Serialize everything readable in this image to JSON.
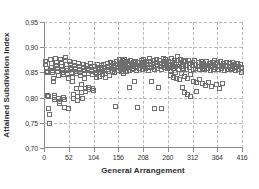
{
  "chart_data": {
    "type": "scatter",
    "title": "",
    "xlabel": "General Arrangement",
    "ylabel": "Attained Subdivision Index",
    "xlim": [
      0,
      416
    ],
    "ylim": [
      0.7,
      0.95
    ],
    "xticks": [
      0,
      52,
      104,
      156,
      208,
      260,
      312,
      364,
      416
    ],
    "xticklabels": [
      "0",
      "52",
      "104",
      "156",
      "208",
      "260",
      "312",
      "364",
      "416"
    ],
    "yticks": [
      0.7,
      0.75,
      0.8,
      0.85,
      0.9,
      0.95
    ],
    "yticklabels": [
      "0,70",
      "0,75",
      "0,80",
      "0,85",
      "0,90",
      "0,95"
    ],
    "decimal_separator": ",",
    "grid": true,
    "grid_style": "dashed",
    "grid_color": "#b9b9b9",
    "axis_color": "#8a8a8a",
    "legend": null,
    "marker": "open-square",
    "marker_color": "#6f6f6f",
    "marker_size": 4,
    "series": [
      {
        "name": "Attained Subdivision Index",
        "points": [
          [
            2,
            0.873
          ],
          [
            3,
            0.866
          ],
          [
            4,
            0.858
          ],
          [
            5,
            0.852
          ],
          [
            6,
            0.851
          ],
          [
            7,
            0.806
          ],
          [
            8,
            0.803
          ],
          [
            9,
            0.779
          ],
          [
            10,
            0.767
          ],
          [
            11,
            0.75
          ],
          [
            13,
            0.877
          ],
          [
            14,
            0.869
          ],
          [
            15,
            0.861
          ],
          [
            16,
            0.855
          ],
          [
            17,
            0.85
          ],
          [
            18,
            0.838
          ],
          [
            19,
            0.833
          ],
          [
            20,
            0.806
          ],
          [
            21,
            0.801
          ],
          [
            22,
            0.798
          ],
          [
            24,
            0.879
          ],
          [
            25,
            0.871
          ],
          [
            26,
            0.864
          ],
          [
            27,
            0.858
          ],
          [
            28,
            0.853
          ],
          [
            29,
            0.845
          ],
          [
            30,
            0.8
          ],
          [
            31,
            0.794
          ],
          [
            32,
            0.789
          ],
          [
            34,
            0.876
          ],
          [
            35,
            0.87
          ],
          [
            36,
            0.862
          ],
          [
            37,
            0.857
          ],
          [
            38,
            0.851
          ],
          [
            39,
            0.846
          ],
          [
            40,
            0.802
          ],
          [
            41,
            0.797
          ],
          [
            42,
            0.781
          ],
          [
            44,
            0.88
          ],
          [
            45,
            0.874
          ],
          [
            46,
            0.867
          ],
          [
            47,
            0.859
          ],
          [
            48,
            0.854
          ],
          [
            49,
            0.848
          ],
          [
            50,
            0.838
          ],
          [
            51,
            0.779
          ],
          [
            53,
            0.873
          ],
          [
            54,
            0.866
          ],
          [
            55,
            0.861
          ],
          [
            56,
            0.856
          ],
          [
            57,
            0.85
          ],
          [
            58,
            0.841
          ],
          [
            59,
            0.832
          ],
          [
            60,
            0.807
          ],
          [
            61,
            0.8
          ],
          [
            63,
            0.87
          ],
          [
            64,
            0.864
          ],
          [
            65,
            0.858
          ],
          [
            66,
            0.853
          ],
          [
            67,
            0.848
          ],
          [
            68,
            0.819
          ],
          [
            69,
            0.804
          ],
          [
            70,
            0.795
          ],
          [
            72,
            0.868
          ],
          [
            73,
            0.862
          ],
          [
            74,
            0.857
          ],
          [
            75,
            0.851
          ],
          [
            76,
            0.845
          ],
          [
            77,
            0.826
          ],
          [
            78,
            0.811
          ],
          [
            79,
            0.8
          ],
          [
            81,
            0.866
          ],
          [
            82,
            0.86
          ],
          [
            83,
            0.855
          ],
          [
            84,
            0.849
          ],
          [
            85,
            0.838
          ],
          [
            86,
            0.82
          ],
          [
            87,
            0.813
          ],
          [
            89,
            0.864
          ],
          [
            90,
            0.859
          ],
          [
            91,
            0.854
          ],
          [
            92,
            0.848
          ],
          [
            93,
            0.822
          ],
          [
            94,
            0.817
          ],
          [
            96,
            0.869
          ],
          [
            97,
            0.863
          ],
          [
            98,
            0.857
          ],
          [
            99,
            0.852
          ],
          [
            100,
            0.846
          ],
          [
            101,
            0.819
          ],
          [
            102,
            0.816
          ],
          [
            106,
            0.862
          ],
          [
            107,
            0.857
          ],
          [
            108,
            0.851
          ],
          [
            109,
            0.846
          ],
          [
            110,
            0.84
          ],
          [
            112,
            0.867
          ],
          [
            113,
            0.861
          ],
          [
            114,
            0.856
          ],
          [
            115,
            0.85
          ],
          [
            116,
            0.843
          ],
          [
            119,
            0.864
          ],
          [
            120,
            0.858
          ],
          [
            121,
            0.853
          ],
          [
            122,
            0.847
          ],
          [
            125,
            0.866
          ],
          [
            126,
            0.86
          ],
          [
            127,
            0.855
          ],
          [
            128,
            0.849
          ],
          [
            129,
            0.841
          ],
          [
            132,
            0.869
          ],
          [
            133,
            0.863
          ],
          [
            134,
            0.857
          ],
          [
            135,
            0.852
          ],
          [
            136,
            0.845
          ],
          [
            139,
            0.871
          ],
          [
            140,
            0.865
          ],
          [
            141,
            0.859
          ],
          [
            142,
            0.853
          ],
          [
            145,
            0.868
          ],
          [
            146,
            0.862
          ],
          [
            147,
            0.856
          ],
          [
            148,
            0.85
          ],
          [
            150,
            0.783
          ],
          [
            152,
            0.873
          ],
          [
            153,
            0.867
          ],
          [
            154,
            0.861
          ],
          [
            155,
            0.855
          ],
          [
            157,
            0.876
          ],
          [
            158,
            0.87
          ],
          [
            159,
            0.864
          ],
          [
            160,
            0.858
          ],
          [
            161,
            0.852
          ],
          [
            163,
            0.874
          ],
          [
            164,
            0.868
          ],
          [
            165,
            0.862
          ],
          [
            166,
            0.856
          ],
          [
            167,
            0.849
          ],
          [
            169,
            0.877
          ],
          [
            170,
            0.871
          ],
          [
            171,
            0.865
          ],
          [
            172,
            0.859
          ],
          [
            173,
            0.853
          ],
          [
            175,
            0.872
          ],
          [
            176,
            0.866
          ],
          [
            177,
            0.86
          ],
          [
            178,
            0.854
          ],
          [
            179,
            0.821
          ],
          [
            181,
            0.875
          ],
          [
            182,
            0.869
          ],
          [
            183,
            0.863
          ],
          [
            184,
            0.857
          ],
          [
            186,
            0.87
          ],
          [
            187,
            0.864
          ],
          [
            188,
            0.858
          ],
          [
            189,
            0.833
          ],
          [
            191,
            0.873
          ],
          [
            192,
            0.867
          ],
          [
            193,
            0.861
          ],
          [
            194,
            0.855
          ],
          [
            196,
            0.781
          ],
          [
            198,
            0.871
          ],
          [
            199,
            0.865
          ],
          [
            200,
            0.859
          ],
          [
            203,
            0.874
          ],
          [
            204,
            0.868
          ],
          [
            205,
            0.862
          ],
          [
            206,
            0.856
          ],
          [
            209,
            0.876
          ],
          [
            210,
            0.87
          ],
          [
            211,
            0.864
          ],
          [
            212,
            0.858
          ],
          [
            215,
            0.873
          ],
          [
            216,
            0.867
          ],
          [
            217,
            0.861
          ],
          [
            218,
            0.855
          ],
          [
            221,
            0.878
          ],
          [
            222,
            0.872
          ],
          [
            223,
            0.866
          ],
          [
            224,
            0.86
          ],
          [
            225,
            0.832
          ],
          [
            228,
            0.875
          ],
          [
            229,
            0.869
          ],
          [
            230,
            0.863
          ],
          [
            231,
            0.857
          ],
          [
            232,
            0.78
          ],
          [
            235,
            0.877
          ],
          [
            236,
            0.871
          ],
          [
            237,
            0.865
          ],
          [
            238,
            0.859
          ],
          [
            239,
            0.822
          ],
          [
            242,
            0.874
          ],
          [
            243,
            0.868
          ],
          [
            244,
            0.862
          ],
          [
            245,
            0.856
          ],
          [
            246,
            0.78
          ],
          [
            249,
            0.879
          ],
          [
            250,
            0.872
          ],
          [
            251,
            0.866
          ],
          [
            252,
            0.86
          ],
          [
            255,
            0.876
          ],
          [
            256,
            0.87
          ],
          [
            257,
            0.864
          ],
          [
            258,
            0.858
          ],
          [
            261,
            0.873
          ],
          [
            262,
            0.867
          ],
          [
            263,
            0.861
          ],
          [
            264,
            0.855
          ],
          [
            265,
            0.845
          ],
          [
            267,
            0.878
          ],
          [
            268,
            0.871
          ],
          [
            269,
            0.865
          ],
          [
            270,
            0.859
          ],
          [
            271,
            0.84
          ],
          [
            273,
            0.875
          ],
          [
            274,
            0.869
          ],
          [
            275,
            0.863
          ],
          [
            276,
            0.851
          ],
          [
            277,
            0.838
          ],
          [
            279,
            0.883
          ],
          [
            280,
            0.874
          ],
          [
            281,
            0.866
          ],
          [
            282,
            0.857
          ],
          [
            283,
            0.836
          ],
          [
            285,
            0.877
          ],
          [
            286,
            0.87
          ],
          [
            287,
            0.862
          ],
          [
            288,
            0.849
          ],
          [
            289,
            0.821
          ],
          [
            291,
            0.874
          ],
          [
            292,
            0.867
          ],
          [
            293,
            0.859
          ],
          [
            294,
            0.843
          ],
          [
            295,
            0.811
          ],
          [
            297,
            0.872
          ],
          [
            298,
            0.865
          ],
          [
            299,
            0.857
          ],
          [
            300,
            0.839
          ],
          [
            301,
            0.808
          ],
          [
            303,
            0.875
          ],
          [
            304,
            0.868
          ],
          [
            305,
            0.86
          ],
          [
            306,
            0.846
          ],
          [
            307,
            0.803
          ],
          [
            310,
            0.871
          ],
          [
            311,
            0.864
          ],
          [
            312,
            0.856
          ],
          [
            313,
            0.833
          ],
          [
            316,
            0.874
          ],
          [
            317,
            0.867
          ],
          [
            318,
            0.859
          ],
          [
            319,
            0.83
          ],
          [
            320,
            0.814
          ],
          [
            323,
            0.87
          ],
          [
            324,
            0.863
          ],
          [
            325,
            0.857
          ],
          [
            326,
            0.836
          ],
          [
            329,
            0.873
          ],
          [
            330,
            0.866
          ],
          [
            331,
            0.859
          ],
          [
            332,
            0.828
          ],
          [
            335,
            0.869
          ],
          [
            336,
            0.863
          ],
          [
            337,
            0.856
          ],
          [
            338,
            0.825
          ],
          [
            341,
            0.872
          ],
          [
            342,
            0.865
          ],
          [
            343,
            0.858
          ],
          [
            344,
            0.831
          ],
          [
            347,
            0.868
          ],
          [
            348,
            0.862
          ],
          [
            349,
            0.855
          ],
          [
            350,
            0.824
          ],
          [
            353,
            0.871
          ],
          [
            354,
            0.864
          ],
          [
            355,
            0.857
          ],
          [
            358,
            0.874
          ],
          [
            359,
            0.867
          ],
          [
            360,
            0.86
          ],
          [
            361,
            0.827
          ],
          [
            364,
            0.87
          ],
          [
            365,
            0.863
          ],
          [
            366,
            0.856
          ],
          [
            367,
            0.82
          ],
          [
            370,
            0.872
          ],
          [
            371,
            0.865
          ],
          [
            372,
            0.858
          ],
          [
            373,
            0.829
          ],
          [
            376,
            0.869
          ],
          [
            377,
            0.862
          ],
          [
            378,
            0.855
          ],
          [
            382,
            0.871
          ],
          [
            383,
            0.864
          ],
          [
            384,
            0.857
          ],
          [
            388,
            0.868
          ],
          [
            389,
            0.862
          ],
          [
            390,
            0.856
          ],
          [
            394,
            0.87
          ],
          [
            395,
            0.864
          ],
          [
            396,
            0.858
          ],
          [
            400,
            0.867
          ],
          [
            401,
            0.861
          ],
          [
            402,
            0.855
          ],
          [
            406,
            0.869
          ],
          [
            407,
            0.863
          ],
          [
            408,
            0.857
          ],
          [
            412,
            0.866
          ],
          [
            413,
            0.86
          ],
          [
            414,
            0.85
          ]
        ]
      }
    ]
  }
}
